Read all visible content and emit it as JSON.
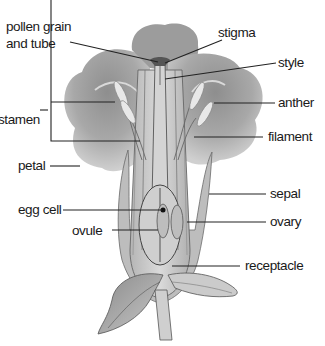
{
  "labels": {
    "pollen_grain": "pollen grain",
    "and_tube": "and tube",
    "stigma": "stigma",
    "style": "style",
    "anther": "anther",
    "stamen": "stamen",
    "filament": "filament",
    "petal": "petal",
    "sepal": "sepal",
    "egg_cell": "egg cell",
    "ovary": "ovary",
    "ovule": "ovule",
    "receptacle": "receptacle"
  },
  "colors": {
    "petal_dark": "#9a9a9a",
    "petal_mid": "#b8b8b8",
    "petal_light": "#d6d6d6",
    "tissue": "#c4c4c4",
    "outline": "#555555",
    "leader": "#222222"
  }
}
